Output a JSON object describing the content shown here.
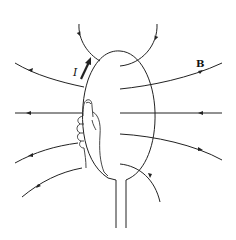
{
  "diagram": {
    "labels": {
      "current": "I",
      "field": "B"
    },
    "colors": {
      "stroke": "#222222",
      "background": "#ffffff"
    },
    "elements": [
      {
        "name": "current-loop",
        "type": "ellipse"
      },
      {
        "name": "lead-wires",
        "type": "pair of vertical lines"
      },
      {
        "name": "right-hand",
        "type": "hand gripping wire, thumb up"
      },
      {
        "name": "current-arrow",
        "label": "I",
        "direction": "up along loop"
      },
      {
        "name": "field-lines",
        "label": "B",
        "count": 10
      }
    ]
  }
}
